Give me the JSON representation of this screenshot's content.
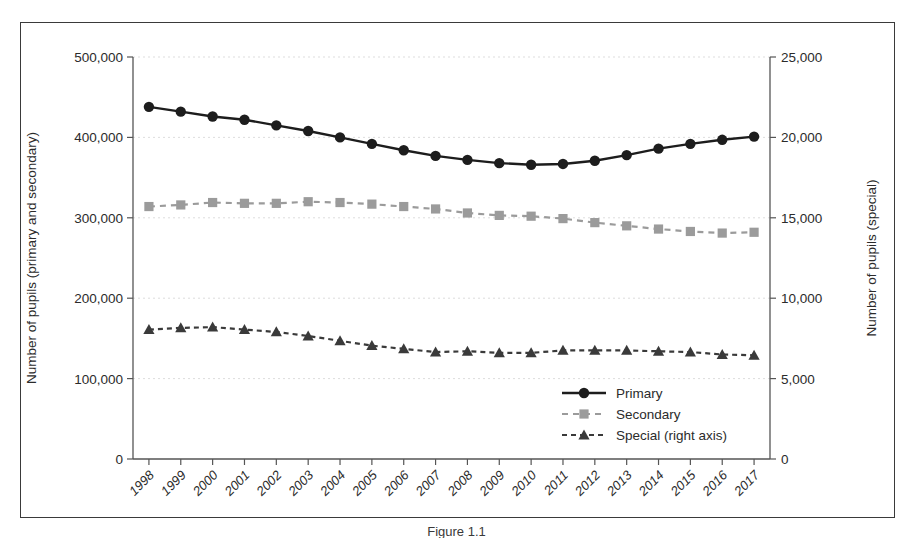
{
  "figure": {
    "caption": "Figure 1.1",
    "border_color": "#3a3a3a"
  },
  "chart_data": {
    "type": "line",
    "title": "",
    "subtitle": "",
    "xlabel": "",
    "ylabel": "Number of pupils (primary and secondary)",
    "y2label": "Number of pupils (special)",
    "grid": true,
    "legend_position": "bottom-right",
    "ylim": [
      0,
      500000
    ],
    "y2lim": [
      0,
      25000
    ],
    "yticks": [
      0,
      100000,
      200000,
      300000,
      400000,
      500000
    ],
    "ytick_labels": [
      "0",
      "100,000",
      "200,000",
      "300,000",
      "400,000",
      "500,000"
    ],
    "y2ticks": [
      0,
      5000,
      10000,
      15000,
      20000,
      25000
    ],
    "y2tick_labels": [
      "0",
      "5,000",
      "10,000",
      "15,000",
      "20,000",
      "25,000"
    ],
    "categories": [
      "1998",
      "1999",
      "2000",
      "2001",
      "2002",
      "2003",
      "2004",
      "2005",
      "2006",
      "2007",
      "2008",
      "2009",
      "2010",
      "2011",
      "2012",
      "2013",
      "2014",
      "2015",
      "2016",
      "2017"
    ],
    "series": [
      {
        "name": "Primary",
        "axis": "left",
        "marker": "circle",
        "line_style": "solid",
        "color": "#1d1d1d",
        "values": [
          438000,
          432000,
          426000,
          422000,
          415000,
          408000,
          400000,
          392000,
          384000,
          377000,
          372000,
          368000,
          366000,
          367000,
          371000,
          378000,
          386000,
          392000,
          397000,
          401000
        ]
      },
      {
        "name": "Secondary",
        "axis": "left",
        "marker": "square",
        "line_style": "dashed",
        "color": "#9b9b9b",
        "values": [
          314000,
          316000,
          319000,
          318000,
          318000,
          320000,
          319000,
          317000,
          314000,
          311000,
          306000,
          303000,
          302000,
          299000,
          294000,
          290000,
          286000,
          283000,
          281000,
          282000
        ]
      },
      {
        "name": "Special (right axis)",
        "axis": "right",
        "marker": "triangle",
        "line_style": "dashed",
        "color": "#3a3a3a",
        "values": [
          8050,
          8150,
          8200,
          8050,
          7900,
          7650,
          7350,
          7050,
          6850,
          6650,
          6700,
          6600,
          6600,
          6750,
          6750,
          6750,
          6700,
          6650,
          6500,
          6450
        ]
      }
    ]
  }
}
